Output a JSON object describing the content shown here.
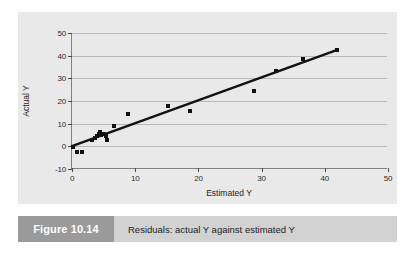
{
  "figure": {
    "number_label": "Figure 10.14",
    "caption": "Residuals: actual Y against estimated Y"
  },
  "colors": {
    "panel_background": "#e9e9e9",
    "page_background": "#ffffff",
    "gridline": "#b8b8b8",
    "axis": "#808080",
    "marker": "#111111",
    "trend_line": "#111111",
    "caption_bar": "#d2d2d2",
    "caption_number_box": "#9a9a9a",
    "caption_number_text": "#ffffff"
  },
  "chart_data": {
    "type": "scatter",
    "title": "",
    "subtitle": "",
    "xlabel": "Estimated Y",
    "ylabel": "Actual Y",
    "xlim": [
      0,
      50
    ],
    "ylim": [
      -10,
      50
    ],
    "xticks": [
      0,
      10,
      20,
      30,
      40,
      50
    ],
    "xtick_labels": [
      "0",
      "10",
      "20",
      "30",
      "40",
      "50"
    ],
    "yticks": [
      -10,
      0,
      10,
      20,
      30,
      40,
      50
    ],
    "ytick_labels": [
      "-10",
      "0",
      "10",
      "20",
      "30",
      "40",
      "50"
    ],
    "grid": "horizontal",
    "legend": "none",
    "marker_style": "filled-square",
    "series": [
      {
        "name": "Observations",
        "x": [
          0.2,
          0.8,
          1.6,
          3.2,
          3.6,
          4.0,
          4.3,
          4.5,
          4.6,
          5.0,
          5.4,
          5.6,
          6.6,
          8.8,
          15.2,
          18.6,
          28.8,
          32.2,
          36.5,
          42.0
        ],
        "y": [
          -0.2,
          -2.6,
          -2.6,
          3.0,
          3.6,
          4.6,
          5.6,
          6.2,
          4.8,
          5.4,
          4.6,
          2.8,
          9.0,
          14.2,
          17.6,
          15.6,
          24.6,
          33.4,
          38.4,
          42.4
        ]
      }
    ],
    "trend_line": {
      "name": "Fitted line",
      "x_start": 0.0,
      "y_start": -0.3,
      "x_end": 42.0,
      "y_end": 42.4
    }
  }
}
